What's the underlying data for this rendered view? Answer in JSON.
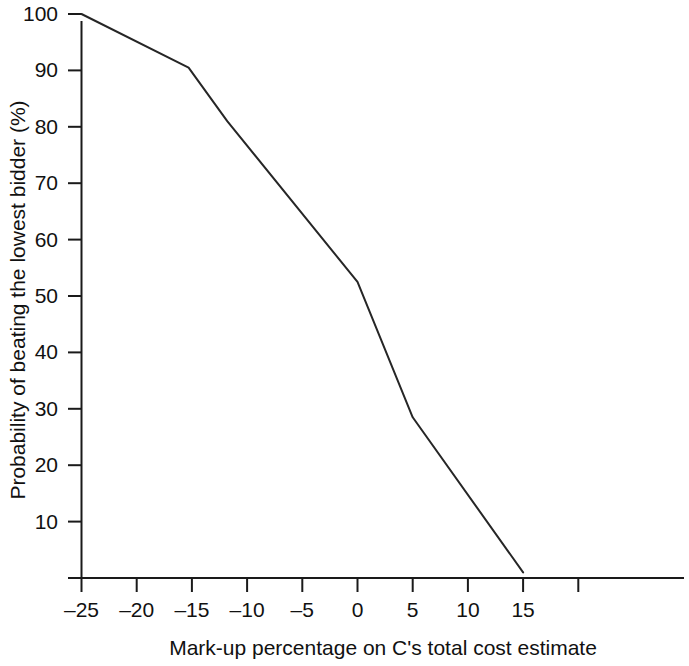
{
  "chart_data": {
    "type": "line",
    "title": "",
    "subtitle": "",
    "xlabel": "Mark-up percentage on C's total cost estimate",
    "ylabel": "Probability of beating the lowest bidder (%)",
    "xlim": [
      -27.5,
      20
    ],
    "ylim": [
      0,
      103
    ],
    "grid": false,
    "legend": null,
    "x_ticks": [
      -25,
      -20,
      -15,
      -10,
      -5,
      0,
      5,
      10,
      15,
      20
    ],
    "x_tick_labels": [
      "–25",
      "–20",
      "–15",
      "–10",
      "–5",
      "0",
      "5",
      "10",
      "15",
      ""
    ],
    "y_ticks": [
      0,
      10,
      20,
      30,
      40,
      50,
      60,
      70,
      80,
      90,
      100
    ],
    "y_tick_labels": [
      "",
      "10",
      "20",
      "30",
      "40",
      "50",
      "60",
      "70",
      "80",
      "90",
      "100"
    ],
    "series": [
      {
        "name": "Probability of beating the lowest bidder",
        "color": "#262626",
        "x": [
          -25,
          -15.3,
          -11.8,
          0,
          5,
          15
        ],
        "values": [
          100,
          90.5,
          81,
          52.5,
          28.5,
          1
        ]
      }
    ],
    "points": [
      {
        "x": -25,
        "y": 100
      },
      {
        "x": -15.3,
        "y": 90.5
      },
      {
        "x": -11.8,
        "y": 81
      },
      {
        "x": 0,
        "y": 52.5
      },
      {
        "x": 5,
        "y": 28.5
      },
      {
        "x": 15,
        "y": 1
      }
    ]
  }
}
